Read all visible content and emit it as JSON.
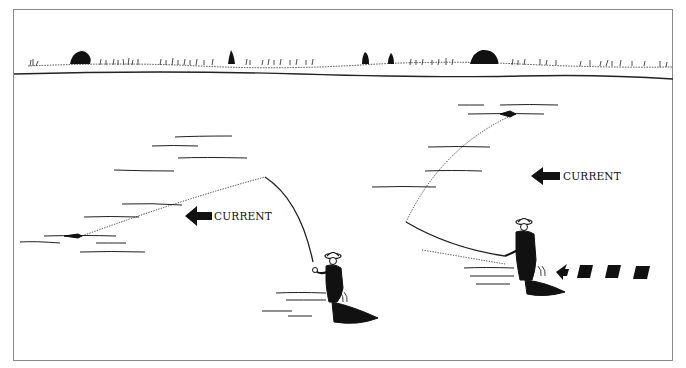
{
  "figure": {
    "left_scene": {
      "current_label": "CURRENT",
      "arrow": "arrow-left-solid"
    },
    "right_scene": {
      "current_label": "CURRENT",
      "arrow": "arrow-left-solid",
      "motion_indicator": "dashed-arrow-left"
    },
    "colors": {
      "ink": "#111111",
      "frame_border": "#8a8a8a",
      "background": "#ffffff"
    }
  }
}
